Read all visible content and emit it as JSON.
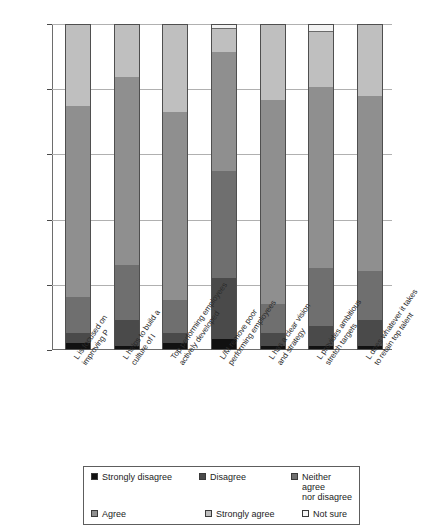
{
  "chart_data": {
    "type": "bar",
    "subtype": "stacked-percent-column",
    "title": "",
    "xlabel": "",
    "ylabel": "",
    "ylim": [
      0,
      100
    ],
    "ytick_labels": [
      "0%",
      "20%",
      "40%",
      "60%",
      "80%",
      "100%"
    ],
    "ytick_values": [
      0,
      20,
      40,
      60,
      80,
      100
    ],
    "grid": true,
    "legend_position": "bottom",
    "categories": [
      "L is focused on\nimproving P",
      "L helps to build a\nculture of I",
      "Top performing employees\nactively developed",
      "L/M remove poor\nperforming employees",
      "L has a clear vision\nand strategy",
      "L provides ambitious\nstretch targets",
      "L does whatever it takes\nto retain top talent"
    ],
    "series": [
      {
        "name": "Strongly disagree",
        "color": "#111111",
        "values": [
          2,
          1,
          2,
          3,
          1,
          1,
          1
        ]
      },
      {
        "name": "Disagree",
        "color": "#4a4a4a",
        "values": [
          3,
          8,
          3,
          19,
          4,
          6,
          8
        ]
      },
      {
        "name": "Neither agree nor disagree",
        "color": "#6f6f6f",
        "values": [
          11,
          17,
          10,
          33,
          9,
          18,
          15
        ]
      },
      {
        "name": "Agree",
        "color": "#8f8f8f",
        "values": [
          59,
          58,
          58,
          37,
          63,
          56,
          54
        ]
      },
      {
        "name": "Strongly agree",
        "color": "#bfbfbf",
        "values": [
          25,
          16,
          27,
          7,
          23,
          17,
          22
        ]
      },
      {
        "name": "Not sure",
        "color": "#f2f2f2",
        "values": [
          0,
          0,
          0,
          1,
          0,
          2,
          0
        ]
      }
    ]
  },
  "legend": {
    "items": [
      {
        "label": "Strongly disagree",
        "color": "#111111"
      },
      {
        "label": "Disagree",
        "color": "#4a4a4a"
      },
      {
        "label": "Neither agree\nnor disagree",
        "color": "#6f6f6f"
      },
      {
        "label": "Agree",
        "color": "#8f8f8f"
      },
      {
        "label": "Strongly agree",
        "color": "#bfbfbf"
      },
      {
        "label": "Not sure",
        "color": "#f7f7f7"
      }
    ]
  }
}
